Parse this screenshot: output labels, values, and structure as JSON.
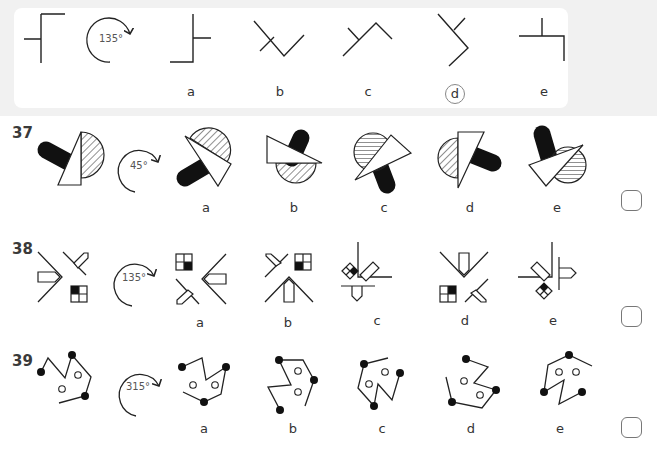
{
  "example": {
    "rotation_label": "135°",
    "option_labels": [
      "a",
      "b",
      "c",
      "d",
      "e"
    ],
    "selected_answer": "d"
  },
  "questions": [
    {
      "number": "37",
      "rotation_label": "45°",
      "option_labels": [
        "a",
        "b",
        "c",
        "d",
        "e"
      ]
    },
    {
      "number": "38",
      "rotation_label": "135°",
      "option_labels": [
        "a",
        "b",
        "c",
        "d",
        "e"
      ]
    },
    {
      "number": "39",
      "rotation_label": "315°",
      "option_labels": [
        "a",
        "b",
        "c",
        "d",
        "e"
      ]
    }
  ],
  "icons": {
    "rotate_arrow": "clockwise-rotation-arrow-icon",
    "answer_box": "answer-checkbox"
  }
}
